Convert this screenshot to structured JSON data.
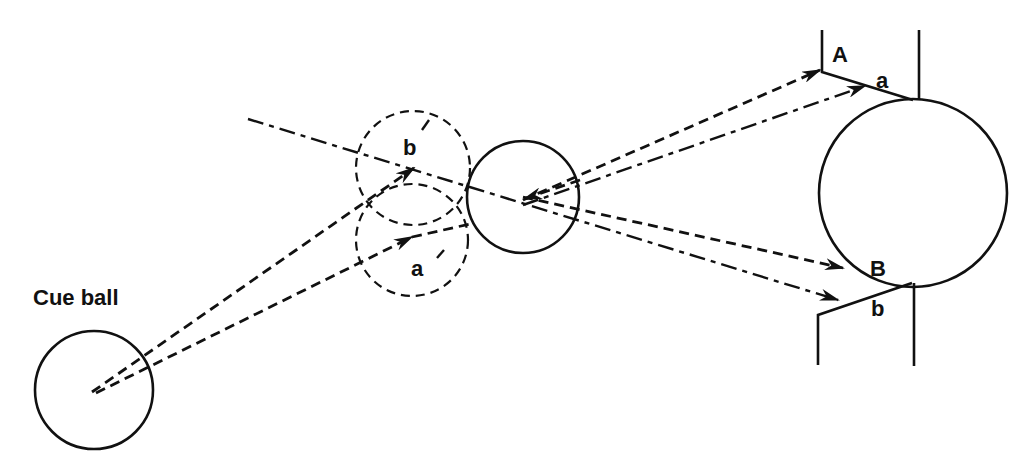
{
  "diagram": {
    "labels": {
      "cue_ball": "Cue ball",
      "ghost_b": "b",
      "ghost_a": "a",
      "target_A": "A",
      "target_a": "a",
      "target_B": "B",
      "target_b": "b"
    },
    "elements": {
      "cue_ball": {
        "cx": 94,
        "cy": 390,
        "r": 59
      },
      "ghost_ball_b": {
        "cx": 413,
        "cy": 168,
        "r": 57
      },
      "ghost_ball_a": {
        "cx": 412,
        "cy": 240,
        "r": 56
      },
      "object_ball": {
        "cx": 523,
        "cy": 197,
        "r": 56
      },
      "pocket_ball": {
        "cx": 913,
        "cy": 193,
        "r": 94
      }
    },
    "line_styles": {
      "cue_paths": "dashed",
      "object_ball_paths": "dashed",
      "reference_paths": "dash-dot"
    },
    "colors": {
      "ink": "#111111",
      "background": "#ffffff"
    }
  }
}
